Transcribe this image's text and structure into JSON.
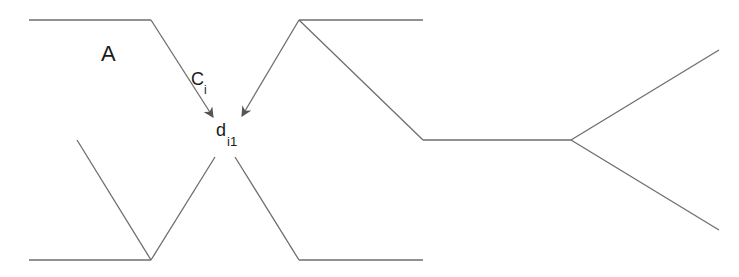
{
  "diagram": {
    "labels": {
      "region": "A",
      "arrow_main": "C",
      "arrow_sub": "i",
      "point_main": "d",
      "point_sub": "i1"
    },
    "colors": {
      "line": "#6e6e6e",
      "text": "#1a1a1a",
      "background": "#ffffff"
    }
  }
}
